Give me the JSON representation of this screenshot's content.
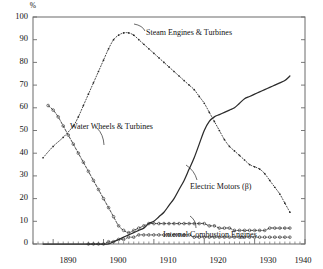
{
  "chart_data": {
    "type": "line",
    "title": "",
    "subtitle": "",
    "xlabel": "",
    "ylabel": "%",
    "xlim": [
      1886,
      1940
    ],
    "ylim": [
      0,
      100
    ],
    "xticks": [
      1890,
      1900,
      1910,
      1920,
      1930,
      1940
    ],
    "yticks": [
      0,
      10,
      20,
      30,
      40,
      50,
      60,
      70,
      80,
      90,
      100
    ],
    "xtick_labels": [
      "1890",
      "1900",
      "1910",
      "1920",
      "1930",
      "1940"
    ],
    "ytick_labels": [
      "0",
      "10",
      "20",
      "30",
      "40",
      "50",
      "60",
      "70",
      "80",
      "90",
      "100"
    ],
    "minor_xticks": true,
    "grid": false,
    "legend": "inline-annotations",
    "frame": "box",
    "series": [
      {
        "name": "Steam Engines & Turbines",
        "marker": "dot",
        "style": "dotted-line",
        "x": [
          1888,
          1890,
          1892,
          1894,
          1895,
          1896,
          1897,
          1898,
          1899,
          1900,
          1901,
          1902,
          1903,
          1904,
          1905,
          1906,
          1907,
          1908,
          1909,
          1910,
          1911,
          1912,
          1913,
          1914,
          1915,
          1916,
          1917,
          1918,
          1919,
          1920,
          1921,
          1922,
          1923,
          1924,
          1925,
          1926,
          1927,
          1928,
          1929,
          1930,
          1931,
          1932,
          1933,
          1934,
          1935,
          1936,
          1937
        ],
        "values": [
          38,
          43,
          47,
          52,
          56,
          61,
          66,
          71,
          76,
          81,
          86,
          90,
          92,
          93,
          93,
          92,
          90,
          88,
          86,
          84,
          82,
          80,
          78,
          76,
          74,
          72,
          70,
          68,
          65,
          62,
          58,
          54,
          50,
          46,
          43,
          41,
          39,
          37,
          35,
          34,
          33,
          31,
          28,
          25,
          22,
          18,
          14
        ]
      },
      {
        "name": "Water Wheels & Turbines",
        "marker": "circle",
        "style": "dashed-dotted",
        "x": [
          1889,
          1890,
          1891,
          1892,
          1893,
          1894,
          1895,
          1896,
          1897,
          1898,
          1899,
          1900,
          1901,
          1902,
          1903,
          1904,
          1905,
          1906,
          1907,
          1908,
          1909,
          1910,
          1911,
          1912,
          1913,
          1914,
          1915,
          1916,
          1917,
          1918,
          1919,
          1920,
          1921,
          1922,
          1923,
          1924,
          1925,
          1926,
          1927,
          1928,
          1929,
          1930,
          1931,
          1932,
          1933,
          1934,
          1935,
          1936,
          1937
        ],
        "values": [
          61,
          59,
          56,
          52,
          48,
          44,
          40,
          36,
          32,
          28,
          24,
          20,
          16,
          12,
          8,
          6,
          5,
          6,
          7,
          8,
          9,
          9,
          9,
          9,
          9,
          9,
          9,
          9,
          9,
          9,
          9,
          9,
          8,
          8,
          7,
          7,
          7,
          6,
          6,
          6,
          6,
          6,
          6,
          6,
          7,
          7,
          7,
          7,
          7
        ]
      },
      {
        "name": "Electric Motors (β)",
        "marker": "none",
        "style": "solid",
        "x": [
          1888,
          1890,
          1892,
          1894,
          1896,
          1898,
          1899,
          1900,
          1901,
          1902,
          1903,
          1904,
          1905,
          1906,
          1907,
          1908,
          1909,
          1910,
          1911,
          1912,
          1913,
          1914,
          1915,
          1916,
          1917,
          1918,
          1919,
          1920,
          1921,
          1922,
          1923,
          1924,
          1925,
          1926,
          1927,
          1928,
          1929,
          1930,
          1931,
          1932,
          1933,
          1934,
          1935,
          1936,
          1937
        ],
        "values": [
          0,
          0,
          0,
          0,
          0,
          0,
          0,
          0,
          0,
          1,
          2,
          3,
          4,
          5,
          6,
          7,
          9,
          10,
          12,
          14,
          17,
          20,
          24,
          28,
          33,
          38,
          44,
          50,
          54,
          56,
          57,
          58,
          59,
          60,
          62,
          64,
          65,
          66,
          67,
          68,
          69,
          70,
          71,
          72,
          74
        ]
      },
      {
        "name": "Internal Combustion Engines",
        "marker": "circle",
        "style": "dotted",
        "x": [
          1897,
          1898,
          1899,
          1900,
          1901,
          1902,
          1903,
          1904,
          1905,
          1906,
          1907,
          1908,
          1909,
          1910,
          1911,
          1912,
          1913,
          1914,
          1915,
          1916,
          1917,
          1918,
          1919,
          1920,
          1921,
          1922,
          1923,
          1924,
          1925,
          1926,
          1927,
          1928,
          1929,
          1930,
          1931,
          1932,
          1933,
          1934,
          1935,
          1936,
          1937
        ],
        "values": [
          0,
          0,
          0,
          0,
          1,
          1,
          2,
          2,
          3,
          3,
          4,
          4,
          4,
          4,
          4,
          4,
          4,
          4,
          4,
          4,
          4,
          3,
          3,
          3,
          3,
          3,
          3,
          3,
          3,
          3,
          3,
          3,
          3,
          3,
          3,
          3,
          3,
          3,
          3,
          3,
          3
        ]
      }
    ],
    "annotations": [
      {
        "text": "Steam Engines & Turbines",
        "x": 1905,
        "y": 92
      },
      {
        "text": "Water Wheels & Turbines",
        "x": 1893,
        "y": 47
      },
      {
        "text": "Electric Motors (β)",
        "x": 1917,
        "y": 22
      },
      {
        "text": "Internal Combustion Engines",
        "x": 1914,
        "y": 5
      }
    ]
  },
  "axes": {
    "y_unit": "%",
    "y_labels": [
      "100",
      "90",
      "80",
      "70",
      "60",
      "50",
      "40",
      "30",
      "20",
      "10",
      "0"
    ],
    "x_labels": [
      "1890",
      "1900",
      "1910",
      "1920",
      "1930",
      "1940"
    ]
  },
  "annotations": {
    "steam": "Steam Engines & Turbines",
    "water": "Water Wheels & Turbines",
    "electric": "Electric Motors (β)",
    "ice": "Internal Combustion Engines"
  },
  "colors": {
    "axis": "#6b6b6b",
    "text": "#111111",
    "line": "#2b2b2b"
  }
}
